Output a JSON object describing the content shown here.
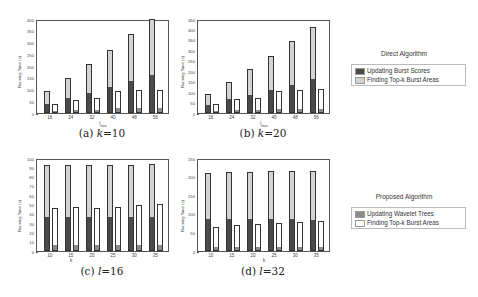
{
  "chart_data": [
    {
      "id": "a",
      "type": "bar",
      "stacked": true,
      "grouped": true,
      "caption": {
        "label": "(a) ",
        "var": "k",
        "eq": "=10"
      },
      "xlabel": "l_max",
      "xlabel_main": "l",
      "xlabel_sub": "max",
      "ylabel": "Running Time (s)",
      "ylim": [
        0,
        400
      ],
      "yticks": [
        0,
        50,
        100,
        150,
        200,
        250,
        300,
        350,
        400
      ],
      "categories": [
        "16",
        "24",
        "32",
        "40",
        "48",
        "56"
      ],
      "series": [
        {
          "group": "Direct Algorithm",
          "name": "Updating Burst Scores",
          "values": [
            35,
            60,
            83,
            105,
            130,
            158
          ]
        },
        {
          "group": "Direct Algorithm",
          "name": "Finding Top-k Burst Areas",
          "values": [
            57,
            90,
            127,
            165,
            205,
            242
          ]
        },
        {
          "group": "Proposed Algorithm",
          "name": "Updating Wavelet Trees",
          "values": [
            5,
            8,
            8,
            15,
            15,
            15
          ]
        },
        {
          "group": "Proposed Algorithm",
          "name": "Finding Top-k Burst Areas",
          "values": [
            35,
            49,
            54,
            77,
            82,
            85
          ]
        }
      ]
    },
    {
      "id": "b",
      "type": "bar",
      "stacked": true,
      "grouped": true,
      "caption": {
        "label": "(b) ",
        "var": "k",
        "eq": "=20"
      },
      "xlabel": "l_max",
      "xlabel_main": "l",
      "xlabel_sub": "max",
      "ylabel": "Running Time (s)",
      "ylim": [
        0,
        450
      ],
      "yticks": [
        0,
        50,
        100,
        150,
        200,
        250,
        300,
        350,
        400,
        450
      ],
      "categories": [
        "16",
        "24",
        "32",
        "40",
        "48",
        "56"
      ],
      "series": [
        {
          "group": "Direct Algorithm",
          "name": "Updating Burst Scores",
          "values": [
            35,
            60,
            80,
            105,
            130,
            160
          ]
        },
        {
          "group": "Direct Algorithm",
          "name": "Finding Top-k Burst Areas",
          "values": [
            57,
            90,
            130,
            170,
            215,
            250
          ]
        },
        {
          "group": "Proposed Algorithm",
          "name": "Updating Wavelet Trees",
          "values": [
            5,
            8,
            8,
            15,
            15,
            15
          ]
        },
        {
          "group": "Proposed Algorithm",
          "name": "Finding Top-k Burst Areas",
          "values": [
            40,
            57,
            62,
            90,
            97,
            100
          ]
        }
      ]
    },
    {
      "id": "c",
      "type": "bar",
      "stacked": true,
      "grouped": true,
      "caption": {
        "label": "(c) ",
        "var": "l",
        "eq": "=16"
      },
      "xlabel": "k",
      "xlabel_main": "k",
      "xlabel_sub": "",
      "ylabel": "Running Time (s)",
      "ylim": [
        0,
        100
      ],
      "yticks": [
        0,
        10,
        20,
        30,
        40,
        50,
        60,
        70,
        80,
        90,
        100
      ],
      "categories": [
        "10",
        "15",
        "20",
        "25",
        "30",
        "35"
      ],
      "series": [
        {
          "group": "Direct Algorithm",
          "name": "Updating Burst Scores",
          "values": [
            35,
            35,
            35,
            35,
            35,
            35
          ]
        },
        {
          "group": "Direct Algorithm",
          "name": "Finding Top-k Burst Areas",
          "values": [
            57,
            58,
            58,
            58,
            58,
            59
          ]
        },
        {
          "group": "Proposed Algorithm",
          "name": "Updating Wavelet Trees",
          "values": [
            5,
            5,
            5,
            5,
            5,
            5
          ]
        },
        {
          "group": "Proposed Algorithm",
          "name": "Finding Top-k Burst Areas",
          "values": [
            41,
            42,
            41,
            42,
            44,
            46
          ]
        }
      ]
    },
    {
      "id": "d",
      "type": "bar",
      "stacked": true,
      "grouped": true,
      "caption": {
        "label": "(d) ",
        "var": "l",
        "eq": "=32"
      },
      "xlabel": "k",
      "xlabel_main": "k",
      "xlabel_sub": "",
      "ylabel": "Running Time (s)",
      "ylim": [
        0,
        250
      ],
      "yticks": [
        0,
        50,
        100,
        150,
        200,
        250
      ],
      "categories": [
        "10",
        "15",
        "20",
        "25",
        "30",
        "35"
      ],
      "series": [
        {
          "group": "Direct Algorithm",
          "name": "Updating Burst Scores",
          "values": [
            83,
            83,
            83,
            83,
            83,
            82
          ]
        },
        {
          "group": "Direct Algorithm",
          "name": "Finding Top-k Burst Areas",
          "values": [
            128,
            129,
            130,
            131,
            131,
            133
          ]
        },
        {
          "group": "Proposed Algorithm",
          "name": "Updating Wavelet Trees",
          "values": [
            9,
            9,
            9,
            9,
            9,
            9
          ]
        },
        {
          "group": "Proposed Algorithm",
          "name": "Finding Top-k Burst Areas",
          "values": [
            56,
            60,
            63,
            66,
            69,
            72
          ]
        }
      ]
    }
  ],
  "legends": {
    "direct": {
      "title": "Direct Algorithm",
      "items": [
        {
          "label": "Updating Burst Scores",
          "color": "#4a4a4a"
        },
        {
          "label": "Finding Top-k Burst Areas",
          "color": "#d3d3d3"
        }
      ]
    },
    "proposed": {
      "title": "Proposed Algorithm",
      "items": [
        {
          "label": "Updating Wavelet Trees",
          "color": "#8c8c8c"
        },
        {
          "label": "Finding Top-k Burst Areas",
          "color": "#ffffff"
        }
      ]
    }
  },
  "colors": {
    "burst_scores": "#4a4a4a",
    "direct_topk": "#d3d3d3",
    "wavelet": "#8c8c8c",
    "proposed_topk": "#ffffff"
  }
}
